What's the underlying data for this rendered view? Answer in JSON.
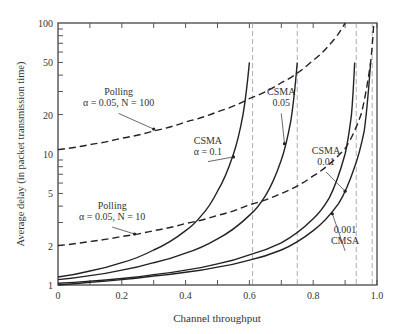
{
  "chart_data": {
    "type": "line",
    "title": "",
    "xlabel": "Channel throughput",
    "ylabel": "Average delay (in packet transmission time)",
    "xlim": [
      0,
      1.0
    ],
    "ylim": [
      1,
      100
    ],
    "yscale": "log",
    "grid": false,
    "x_ticks": [
      "0",
      "0.2",
      "0.4",
      "0.6",
      "0.8",
      "1.0"
    ],
    "y_ticks": [
      "1",
      "2",
      "5",
      "10",
      "20",
      "50",
      "100"
    ],
    "vertical_asymptotes": [
      0.61,
      0.75,
      0.935,
      0.985
    ],
    "series": [
      {
        "name": "Polling α = 0.05, N = 100",
        "style": "dashed",
        "x": [
          0,
          0.1,
          0.2,
          0.3,
          0.4,
          0.5,
          0.6,
          0.7,
          0.8,
          0.85,
          0.9
        ],
        "y": [
          10.8,
          11.8,
          13.2,
          15,
          17.6,
          21,
          26.5,
          35,
          52,
          68,
          100
        ]
      },
      {
        "name": "Polling α = 0.05, N = 10",
        "style": "dashed",
        "x": [
          0,
          0.1,
          0.2,
          0.3,
          0.4,
          0.5,
          0.6,
          0.7,
          0.8,
          0.9,
          0.95,
          0.98,
          0.99
        ],
        "y": [
          2.0,
          2.15,
          2.35,
          2.6,
          2.95,
          3.4,
          4.1,
          5.0,
          6.8,
          11,
          20,
          50,
          100
        ]
      },
      {
        "name": "CSMA α = 0.1",
        "style": "solid",
        "x": [
          0,
          0.1,
          0.2,
          0.3,
          0.4,
          0.45,
          0.5,
          0.55,
          0.58,
          0.6
        ],
        "y": [
          1.15,
          1.28,
          1.48,
          1.85,
          2.6,
          3.4,
          5.2,
          10,
          20,
          50
        ]
      },
      {
        "name": "CSMA α = 0.05",
        "style": "solid",
        "x": [
          0,
          0.1,
          0.2,
          0.3,
          0.4,
          0.5,
          0.6,
          0.65,
          0.7,
          0.73,
          0.75
        ],
        "y": [
          1.1,
          1.18,
          1.3,
          1.48,
          1.75,
          2.25,
          3.4,
          4.8,
          9,
          18,
          50
        ]
      },
      {
        "name": "CSMA α = 0.01",
        "style": "solid",
        "x": [
          0,
          0.1,
          0.2,
          0.3,
          0.4,
          0.5,
          0.6,
          0.7,
          0.8,
          0.85,
          0.9,
          0.92,
          0.93
        ],
        "y": [
          1.03,
          1.07,
          1.12,
          1.2,
          1.3,
          1.45,
          1.7,
          2.1,
          3.2,
          4.6,
          10,
          20,
          50
        ]
      },
      {
        "name": "CMSA α = 0.001",
        "style": "solid",
        "x": [
          0,
          0.1,
          0.2,
          0.3,
          0.4,
          0.5,
          0.6,
          0.7,
          0.8,
          0.88,
          0.93,
          0.96,
          0.98
        ],
        "y": [
          1.0,
          1.05,
          1.1,
          1.17,
          1.25,
          1.37,
          1.55,
          1.85,
          2.6,
          4.2,
          8,
          15,
          50
        ]
      }
    ],
    "annotations": [
      {
        "text": [
          "Polling",
          "α = 0.05, N = 100"
        ],
        "x": 0.19,
        "y": 28,
        "arrow_to": [
          0.3,
          15.5
        ]
      },
      {
        "text": [
          "Polling",
          "α = 0.05, N = 10"
        ],
        "x": 0.17,
        "y": 3.8,
        "arrow_to": [
          0.24,
          2.45
        ]
      },
      {
        "text": [
          "CSMA",
          "α = 0.1"
        ],
        "x": 0.47,
        "y": 12,
        "arrow_to": [
          0.55,
          9.5
        ]
      },
      {
        "text": [
          "CSMA",
          "0.05"
        ],
        "x": 0.7,
        "y": 28,
        "arrow_to": [
          0.71,
          12
        ]
      },
      {
        "text": [
          "CSMA",
          "0.01"
        ],
        "x": 0.84,
        "y": 10,
        "arrow_to": [
          0.9,
          5.2
        ]
      },
      {
        "text": [
          "0.001",
          "CMSA"
        ],
        "x": 0.9,
        "y": 2.5,
        "arrow_to": [
          0.86,
          3.5
        ]
      }
    ]
  }
}
